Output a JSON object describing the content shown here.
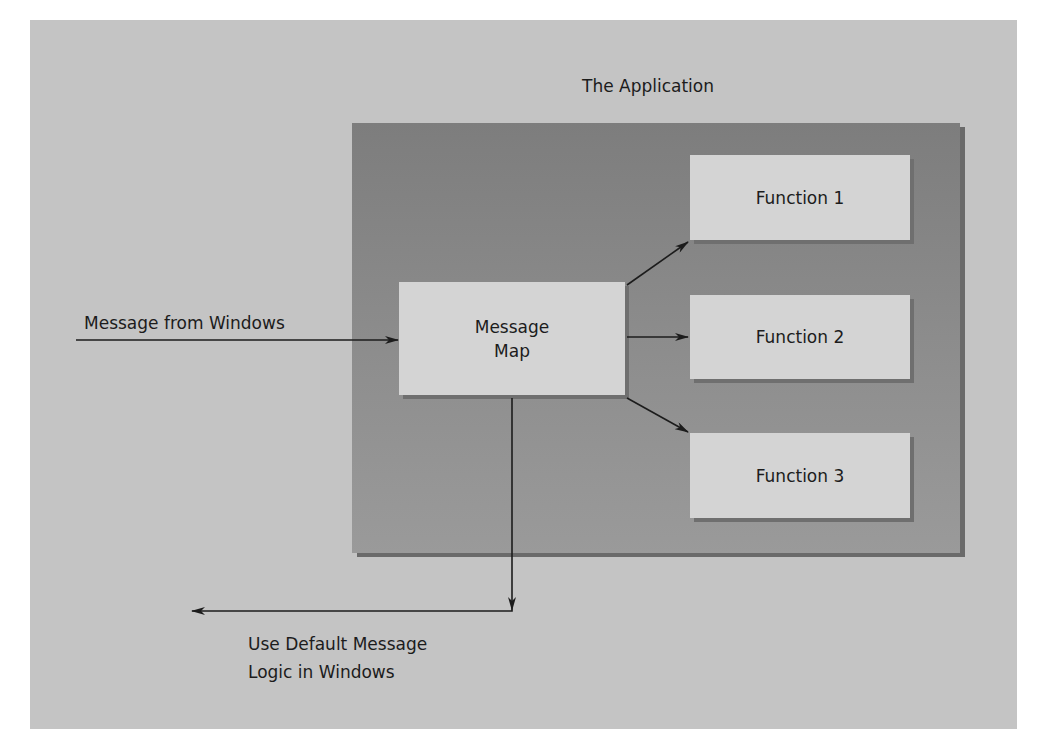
{
  "diagram": {
    "title": "The Application",
    "nodes": {
      "message_map": {
        "line1": "Message",
        "line2": "Map"
      },
      "function1": "Function 1",
      "function2": "Function 2",
      "function3": "Function 3"
    },
    "labels": {
      "input": "Message from Windows",
      "default_line1": "Use Default Message",
      "default_line2": "Logic in Windows"
    },
    "edges": [
      {
        "from": "Message from Windows",
        "to": "Message Map"
      },
      {
        "from": "Message Map",
        "to": "Function 1"
      },
      {
        "from": "Message Map",
        "to": "Function 2"
      },
      {
        "from": "Message Map",
        "to": "Function 3"
      },
      {
        "from": "Message Map",
        "to": "Use Default Message Logic in Windows"
      }
    ],
    "colors": {
      "panel": "#c4c4c4",
      "application": "#888888",
      "node": "#d4d4d4",
      "line": "#1c1c1c"
    }
  }
}
